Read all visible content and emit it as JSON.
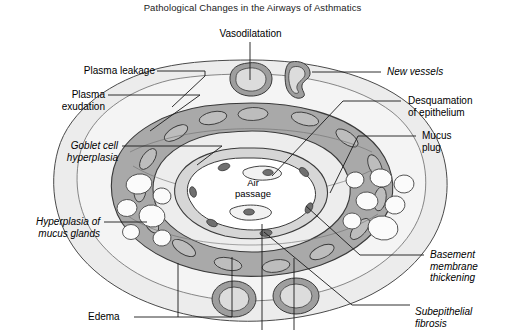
{
  "figure": {
    "title": "Pathological Changes in the Airways of Asthmatics",
    "center_label": "Air\npassage"
  },
  "labels": {
    "vasodilatation": "Vasodilatation",
    "plasma_leakage": "Plasma leakage",
    "plasma_exudation": "Plasma\nexudation",
    "goblet_cell_hyperplasia": "Goblet cell\nhyperplasia",
    "hyperplasia_of_mucus_glands": "Hyperplasia of\nmucus glands",
    "edema": "Edema",
    "new_vessels": "New vessels",
    "desquamation_of_epithelium": "Desquamation\nof epithelium",
    "mucus_plug": "Mucus\nplug",
    "basement_membrane_thickening": "Basement\nmembrane\nthickening",
    "subepithelial_fibrosis": "Subepithelial\nfibrosis"
  },
  "colors": {
    "background": "#ffffff",
    "outer_tissue": "#ececec",
    "inner_tissue": "#f4f4f4",
    "submucosa": "#f7f7f7",
    "smooth_muscle": "#a9a9a9",
    "muscle_cell": "#b9b9b9",
    "vessel_wall": "#9e9e9e",
    "vessel_lumen": "#d8d8d8",
    "lumen": "#ffffff",
    "outline": "#3a3a3a",
    "leader": "#1a1a1a"
  }
}
